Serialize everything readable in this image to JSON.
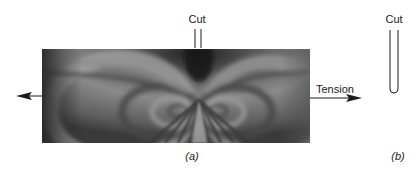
{
  "figure": {
    "panel_a": {
      "photo_description": "Photoelastic fringe pattern of a plate in tension with a central cut",
      "cut_label": "Cut",
      "tension_label": "Tension",
      "caption": "(a)"
    },
    "panel_b": {
      "cut_label": "Cut",
      "caption": "(b)"
    },
    "colors": {
      "ink": "#1a1a1a",
      "photo_dark": "#2e2e2e",
      "photo_mid": "#6e6e6e",
      "photo_light": "#a8a8a8",
      "background": "#ffffff"
    }
  }
}
